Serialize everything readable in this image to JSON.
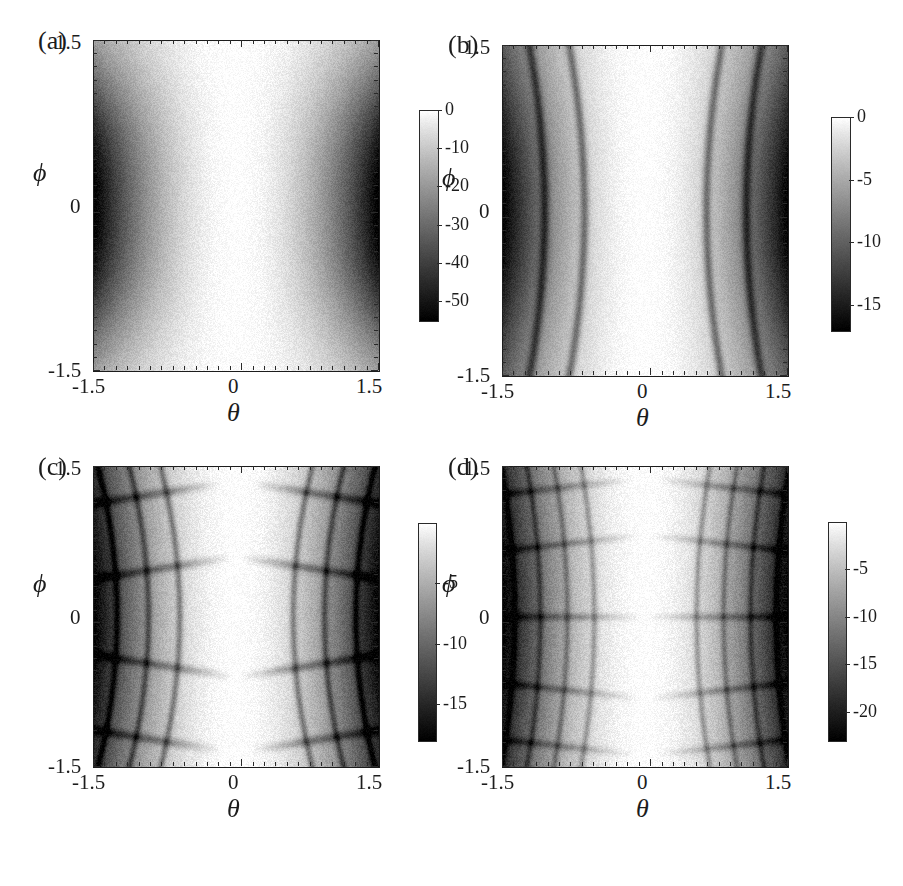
{
  "figure": {
    "width": 903,
    "height": 886,
    "background": "#ffffff",
    "ink": "#1c1c1c"
  },
  "panels": [
    {
      "id": "a",
      "label": "(a)",
      "xlabel": "θ",
      "ylabel": "ϕ",
      "xticks": [
        "-1.5",
        "0",
        "1.5"
      ],
      "yticks": [
        "1.5",
        "0",
        "-1.5"
      ],
      "colorbar_ticks": [
        "0",
        "-10",
        "-20",
        "-30",
        "-40",
        "-50"
      ]
    },
    {
      "id": "b",
      "label": "(b)",
      "xlabel": "θ",
      "ylabel": "ϕ",
      "xticks": [
        "-1.5",
        "0",
        "1.5"
      ],
      "yticks": [
        "1.5",
        "0",
        "-1.5"
      ],
      "colorbar_ticks": [
        "0",
        "-5",
        "-10",
        "-15"
      ]
    },
    {
      "id": "c",
      "label": "(c)",
      "xlabel": "θ",
      "ylabel": "ϕ",
      "xticks": [
        "-1.5",
        "0",
        "1.5"
      ],
      "yticks": [
        "1.5",
        "0",
        "-1.5"
      ],
      "colorbar_ticks": [
        "-5",
        "-10",
        "-15"
      ]
    },
    {
      "id": "d",
      "label": "(d)",
      "xlabel": "θ",
      "ylabel": "ϕ",
      "xticks": [
        "-1.5",
        "0",
        "1.5"
      ],
      "yticks": [
        "1.5",
        "0",
        "-1.5"
      ],
      "colorbar_ticks": [
        "-5",
        "-10",
        "-15",
        "-20"
      ]
    }
  ],
  "chart_data": [
    {
      "type": "heatmap",
      "panel": "a",
      "title": "(a)",
      "xlabel": "θ",
      "ylabel": "ϕ",
      "xlim": [
        -1.5,
        1.5
      ],
      "ylim": [
        -1.5,
        1.5
      ],
      "xticks": [
        -1.5,
        0,
        1.5
      ],
      "yticks": [
        -1.5,
        0,
        1.5
      ],
      "colorbar": {
        "ticks": [
          0,
          -10,
          -20,
          -30,
          -40,
          -50
        ],
        "vmin": -55,
        "vmax": 0,
        "colormap": "grayscale-reversed",
        "high_color": "#ffffff",
        "low_color": "#000000"
      },
      "grid": false,
      "description": "Smooth logarithmic intensity map, two dark lobes centered near theta = -1.4 and theta = +1.4 at phi = 0, bright white vertical band at theta = 0, minimum about -55 dB",
      "value_extrema": {
        "min": -55,
        "max": 0
      },
      "samples": {
        "comment": "Approximate log-intensity (dB) on a 9x9 grid, theta across columns -1.5..1.5, phi down rows 1.5..-1.5",
        "theta": [
          -1.5,
          -1.125,
          -0.75,
          -0.375,
          0,
          0.375,
          0.75,
          1.125,
          1.5
        ],
        "phi": [
          1.5,
          1.125,
          0.75,
          0.375,
          0,
          -0.375,
          -0.75,
          -1.125,
          -1.5
        ],
        "values": [
          [
            -14,
            -12,
            -7,
            -3,
            -1,
            -3,
            -7,
            -12,
            -14
          ],
          [
            -28,
            -23,
            -13,
            -5,
            -1,
            -5,
            -13,
            -23,
            -28
          ],
          [
            -41,
            -34,
            -20,
            -7,
            -1,
            -7,
            -20,
            -34,
            -41
          ],
          [
            -50,
            -42,
            -25,
            -9,
            -1,
            -9,
            -25,
            -42,
            -50
          ],
          [
            -54,
            -45,
            -27,
            -10,
            -1,
            -10,
            -27,
            -45,
            -54
          ],
          [
            -50,
            -42,
            -25,
            -9,
            -1,
            -9,
            -25,
            -42,
            -50
          ],
          [
            -41,
            -34,
            -20,
            -7,
            -1,
            -7,
            -20,
            -34,
            -41
          ],
          [
            -28,
            -23,
            -13,
            -5,
            -1,
            -5,
            -13,
            -23,
            -28
          ],
          [
            -14,
            -12,
            -7,
            -3,
            -1,
            -3,
            -7,
            -12,
            -14
          ]
        ]
      }
    },
    {
      "type": "heatmap",
      "panel": "b",
      "title": "(b)",
      "xlabel": "θ",
      "ylabel": "ϕ",
      "xlim": [
        -1.5,
        1.5
      ],
      "ylim": [
        -1.5,
        1.5
      ],
      "xticks": [
        -1.5,
        0,
        1.5
      ],
      "yticks": [
        -1.5,
        0,
        1.5
      ],
      "colorbar": {
        "ticks": [
          0,
          -5,
          -10,
          -15
        ],
        "vmin": -17,
        "vmax": 0,
        "colormap": "grayscale-reversed",
        "high_color": "#ffffff",
        "low_color": "#000000"
      },
      "grid": false,
      "description": "Two dark lobes with two nested curved nodal arcs on each side; bright white vertical channel at theta = 0; minimum about -17 dB",
      "value_extrema": {
        "min": -17,
        "max": 0
      },
      "nodal_lines": 2,
      "samples": {
        "theta": [
          -1.5,
          -1.125,
          -0.75,
          -0.375,
          0,
          0.375,
          0.75,
          1.125,
          1.5
        ],
        "phi": [
          1.5,
          1.125,
          0.75,
          0.375,
          0,
          -0.375,
          -0.75,
          -1.125,
          -1.5
        ],
        "values": [
          [
            -9,
            -8,
            -6,
            -2,
            -0.5,
            -2,
            -6,
            -8,
            -9
          ],
          [
            -13,
            -12,
            -8,
            -3,
            -0.5,
            -3,
            -8,
            -12,
            -13
          ],
          [
            -15,
            -14,
            -9,
            -3,
            -0.5,
            -3,
            -9,
            -14,
            -15
          ],
          [
            -16,
            -15,
            -10,
            -3,
            -0.5,
            -3,
            -10,
            -15,
            -16
          ],
          [
            -16,
            -16,
            -10,
            -3,
            -0.5,
            -3,
            -10,
            -16,
            -16
          ],
          [
            -16,
            -15,
            -10,
            -3,
            -0.5,
            -3,
            -10,
            -15,
            -16
          ],
          [
            -15,
            -14,
            -9,
            -3,
            -0.5,
            -3,
            -9,
            -14,
            -15
          ],
          [
            -13,
            -12,
            -8,
            -3,
            -0.5,
            -3,
            -8,
            -12,
            -13
          ],
          [
            -9,
            -8,
            -6,
            -2,
            -0.5,
            -2,
            -6,
            -8,
            -9
          ]
        ]
      }
    },
    {
      "type": "heatmap",
      "panel": "c",
      "title": "(c)",
      "xlabel": "θ",
      "ylabel": "ϕ",
      "xlim": [
        -1.5,
        1.5
      ],
      "ylim": [
        -1.5,
        1.5
      ],
      "xticks": [
        -1.5,
        0,
        1.5
      ],
      "yticks": [
        -1.5,
        0,
        1.5
      ],
      "colorbar": {
        "ticks": [
          -5,
          -10,
          -15
        ],
        "vmin": -18,
        "vmax": 0,
        "colormap": "grayscale-reversed",
        "high_color": "#ffffff",
        "low_color": "#000000"
      },
      "grid": false,
      "description": "Criss-crossed lattice of dark nodal lines forming curved cells on each side of a broad bright central band at theta = 0; about 4 horizontal nodal families and 3 vertical ones per side; minimum about -18 dB",
      "value_extrema": {
        "min": -18,
        "max": 0
      },
      "nodal_lines_horizontal": 4,
      "nodal_lines_vertical": 3,
      "samples": {
        "theta": [
          -1.5,
          -1.125,
          -0.75,
          -0.375,
          0,
          0.375,
          0.75,
          1.125,
          1.5
        ],
        "phi": [
          1.5,
          1.125,
          0.75,
          0.375,
          0,
          -0.375,
          -0.75,
          -1.125,
          -1.5
        ],
        "values": [
          [
            -12,
            -10,
            -7,
            -2,
            -0.3,
            -2,
            -7,
            -10,
            -12
          ],
          [
            -14,
            -12,
            -8,
            -2,
            -0.3,
            -2,
            -8,
            -12,
            -14
          ],
          [
            -15,
            -13,
            -8,
            -2,
            -0.3,
            -2,
            -8,
            -13,
            -15
          ],
          [
            -15,
            -13,
            -9,
            -2,
            -0.3,
            -2,
            -9,
            -13,
            -15
          ],
          [
            -16,
            -14,
            -9,
            -2,
            -0.3,
            -2,
            -9,
            -14,
            -16
          ],
          [
            -15,
            -13,
            -9,
            -2,
            -0.3,
            -2,
            -9,
            -13,
            -15
          ],
          [
            -15,
            -13,
            -8,
            -2,
            -0.3,
            -2,
            -8,
            -13,
            -15
          ],
          [
            -14,
            -12,
            -8,
            -2,
            -0.3,
            -2,
            -8,
            -12,
            -14
          ],
          [
            -12,
            -10,
            -7,
            -2,
            -0.3,
            -2,
            -7,
            -10,
            -12
          ]
        ]
      }
    },
    {
      "type": "heatmap",
      "panel": "d",
      "title": "(d)",
      "xlabel": "θ",
      "ylabel": "ϕ",
      "xlim": [
        -1.5,
        1.5
      ],
      "ylim": [
        -1.5,
        1.5
      ],
      "xticks": [
        -1.5,
        0,
        1.5
      ],
      "yticks": [
        -1.5,
        0,
        1.5
      ],
      "colorbar": {
        "ticks": [
          -5,
          -10,
          -15,
          -20
        ],
        "vmin": -23,
        "vmax": 0,
        "colormap": "grayscale-reversed",
        "high_color": "#ffffff",
        "low_color": "#000000"
      },
      "grid": false,
      "description": "Denser nodal lattice than (c): about 5 horizontal and 4 vertical nodal families per side, narrower bright central band at theta = 0; minimum about -23 dB",
      "value_extrema": {
        "min": -23,
        "max": 0
      },
      "nodal_lines_horizontal": 5,
      "nodal_lines_vertical": 4,
      "samples": {
        "theta": [
          -1.5,
          -1.125,
          -0.75,
          -0.375,
          0,
          0.375,
          0.75,
          1.125,
          1.5
        ],
        "phi": [
          1.5,
          1.125,
          0.75,
          0.375,
          0,
          -0.375,
          -0.75,
          -1.125,
          -1.5
        ],
        "values": [
          [
            -15,
            -13,
            -8,
            -2,
            -0.2,
            -2,
            -8,
            -13,
            -15
          ],
          [
            -18,
            -15,
            -9,
            -2,
            -0.2,
            -2,
            -9,
            -15,
            -18
          ],
          [
            -19,
            -16,
            -10,
            -2,
            -0.2,
            -2,
            -10,
            -16,
            -19
          ],
          [
            -20,
            -17,
            -10,
            -2,
            -0.2,
            -2,
            -10,
            -17,
            -20
          ],
          [
            -21,
            -18,
            -11,
            -2,
            -0.2,
            -2,
            -11,
            -18,
            -21
          ],
          [
            -20,
            -17,
            -10,
            -2,
            -0.2,
            -2,
            -10,
            -17,
            -20
          ],
          [
            -19,
            -16,
            -10,
            -2,
            -0.2,
            -2,
            -10,
            -16,
            -19
          ],
          [
            -18,
            -15,
            -9,
            -2,
            -0.2,
            -2,
            -9,
            -15,
            -18
          ],
          [
            -15,
            -13,
            -8,
            -2,
            -0.2,
            -2,
            -8,
            -13,
            -15
          ]
        ]
      }
    }
  ]
}
